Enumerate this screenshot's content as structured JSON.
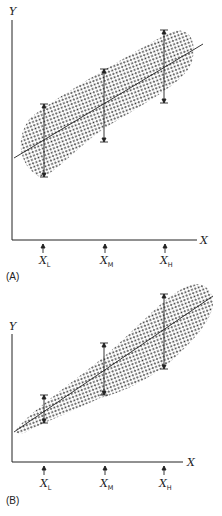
{
  "figure": {
    "panels": [
      {
        "id": "A",
        "label": "(A)",
        "y_axis_label": "Y",
        "x_axis_label": "X",
        "ticks": [
          {
            "main": "X",
            "sub": "L"
          },
          {
            "main": "X",
            "sub": "M"
          },
          {
            "main": "X",
            "sub": "H"
          }
        ],
        "description": "Constant-width scatter band around regression line (homoscedastic); equal-length spread bars at X_L, X_M, X_H"
      },
      {
        "id": "B",
        "label": "(B)",
        "y_axis_label": "Y",
        "x_axis_label": "X",
        "ticks": [
          {
            "main": "X",
            "sub": "L"
          },
          {
            "main": "X",
            "sub": "M"
          },
          {
            "main": "X",
            "sub": "H"
          }
        ],
        "description": "Fan-shaped scatter widening with X around regression line (heteroscedastic); spread bars increase from X_L to X_H"
      }
    ]
  },
  "colors": {
    "ink": "#222222",
    "dots": "#333333",
    "background": "#ffffff"
  }
}
